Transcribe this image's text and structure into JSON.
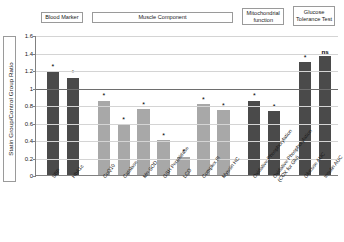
{
  "chart_data": {
    "type": "bar",
    "title": "",
    "xlabel": "",
    "ylabel": "Statin Group/Control Group Ratio",
    "ylim": [
      0,
      1.6
    ],
    "ytick_labels": [
      "1.6",
      "1.4",
      "1.2",
      "1",
      "0.8",
      "0.6",
      "0.4",
      "0.2",
      "0"
    ],
    "ytick_values": [
      1.6,
      1.4,
      1.2,
      1.0,
      0.8,
      0.6,
      0.4,
      0.2,
      0
    ],
    "grid": true,
    "legend": "none",
    "reference_line": 1.0,
    "categories": [
      "SBP",
      "HbA1c",
      "CoQ10",
      "Catalase",
      "Mn-SOD",
      "GSH Peroxidase",
      "LCO",
      "Complex III",
      "Myosin HC",
      "Oxidative Phosphorylation",
      "Oxidative Phosphorylation (COX for Glu)",
      "Glucose AUC",
      "Insulin AUC"
    ],
    "values": [
      1.18,
      1.11,
      0.85,
      0.58,
      0.75,
      0.4,
      0.21,
      0.81,
      0.74,
      0.85,
      0.73,
      1.29,
      1.36
    ],
    "annotations": [
      "*",
      "*",
      "*",
      "*",
      "*",
      "*",
      "*",
      "*",
      "*",
      "*",
      "*",
      "*",
      "ns"
    ],
    "bar_colors": [
      "#4a4a4a",
      "#4a4a4a",
      "#a8a8a8",
      "#a8a8a8",
      "#a8a8a8",
      "#a8a8a8",
      "#a8a8a8",
      "#a8a8a8",
      "#a8a8a8",
      "#4a4a4a",
      "#4a4a4a",
      "#4a4a4a",
      "#4a4a4a"
    ],
    "groups": [
      {
        "label": "Blood Marker",
        "start": 0,
        "end": 1
      },
      {
        "label": "Muscle Component",
        "start": 2,
        "end": 8
      },
      {
        "label": "Mitochondrial function",
        "start": 9,
        "end": 10
      },
      {
        "label": "Glucose Tolerance Test",
        "start": 11,
        "end": 12
      }
    ],
    "colors": {
      "dark_bar": "#4a4a4a",
      "light_bar": "#a8a8a8",
      "grid": "#d4d4d4",
      "axis": "#808080",
      "reference_line": "#6e6e6e",
      "text": "#1a1a1a"
    }
  }
}
